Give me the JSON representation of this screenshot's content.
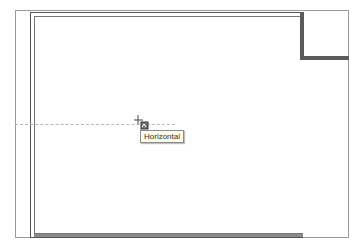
{
  "canvas": {
    "background": "#ffffff",
    "wall_color": "#5a5a5a",
    "frame_color": "#9a9a9a"
  },
  "cursor": {
    "icon": "crosshair-snap-cursor-icon",
    "x": 138,
    "y": 120
  },
  "guide": {
    "orientation": "horizontal",
    "style": "dashed"
  },
  "tooltip": {
    "text": "Horizontal"
  }
}
